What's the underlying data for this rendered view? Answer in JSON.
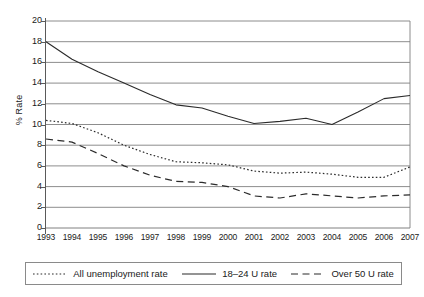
{
  "chart_data": {
    "type": "line",
    "title": "",
    "xlabel": "",
    "ylabel": "% Rate",
    "ylim": [
      0,
      20
    ],
    "ytick_step": 2,
    "yticks": [
      0,
      2,
      4,
      6,
      8,
      10,
      12,
      14,
      16,
      18,
      20
    ],
    "grid": true,
    "grid_axis": "y",
    "legend_position": "bottom",
    "categories": [
      "1993",
      "1994",
      "1995",
      "1996",
      "1997",
      "1998",
      "1999",
      "2000",
      "2001",
      "2002",
      "2003",
      "2004",
      "2005",
      "2006",
      "2007"
    ],
    "series": [
      {
        "name": "All unemployment rate",
        "style": "dotted",
        "values": [
          10.4,
          10.1,
          9.2,
          8.0,
          7.1,
          6.4,
          6.3,
          6.1,
          5.5,
          5.3,
          5.4,
          5.2,
          4.9,
          4.9,
          5.9
        ]
      },
      {
        "name": "18–24 U rate",
        "style": "solid",
        "values": [
          18.0,
          16.3,
          15.1,
          14.0,
          12.9,
          11.9,
          11.6,
          10.8,
          10.1,
          10.3,
          10.6,
          10.0,
          11.2,
          12.5,
          12.8
        ]
      },
      {
        "name": "Over 50 U rate",
        "style": "dashed",
        "values": [
          8.6,
          8.3,
          7.2,
          6.0,
          5.1,
          4.5,
          4.4,
          4.0,
          3.1,
          2.9,
          3.3,
          3.1,
          2.9,
          3.1,
          3.2
        ]
      }
    ]
  },
  "axes": {
    "y_title": "% Rate"
  },
  "legend": {
    "items": [
      {
        "label": "All unemployment rate",
        "style": "dotted"
      },
      {
        "label": "18–24 U rate",
        "style": "solid"
      },
      {
        "label": "Over 50 U rate",
        "style": "dashed"
      }
    ]
  },
  "colors": {
    "line": "#2b2b2b",
    "grid": "#808080",
    "axis": "#5a5a5a",
    "background": "#ffffff",
    "text": "#1a1a1a"
  }
}
